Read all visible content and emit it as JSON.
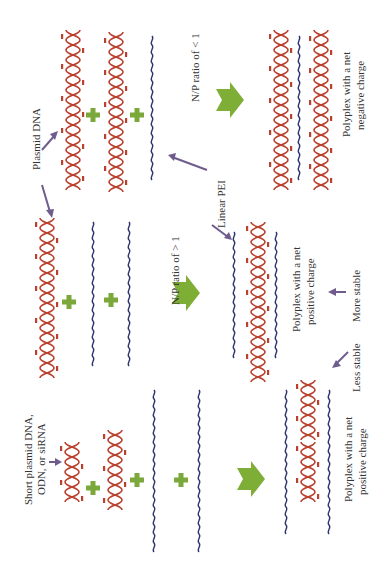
{
  "orientation": "rotated-90-ccw",
  "colors": {
    "dna": "#b9412e",
    "pei": "#2c3570",
    "plus": "#7aa83a",
    "arrow_green": "#7fae36",
    "arrow_purple": "#6e5c8e",
    "text": "#333333"
  },
  "labels": {
    "plasmid_dna": "Plasmid DNA",
    "short_dna_line1": "Short plasmid DNA,",
    "short_dna_line2": "ODN, or siRNA",
    "linear_pei": "Linear PEI",
    "np_less": "N/P ratio of < 1",
    "np_greater": "N/P ratio of > 1",
    "polyplex_negative_line1": "Polyplex with a net",
    "polyplex_negative_line2": "negative charge",
    "polyplex_positive_line1": "Polyplex with a net",
    "polyplex_positive_line2": "positive charge",
    "polyplex_positive2_line1": "Polyplex with a net",
    "polyplex_positive2_line2": "positive charge",
    "more_stable": "More stable",
    "less_stable": "Less stable"
  },
  "pei_groups": {
    "nh2": "NH₂",
    "nh3": "NH₃⁺",
    "plus": "+"
  },
  "rows": [
    {
      "name": "top-row",
      "reactants": [
        "plasmid-dna",
        "plasmid-dna",
        "linear-pei"
      ],
      "condition": "N/P ratio of < 1",
      "product": "polyplex-net-negative"
    },
    {
      "name": "middle-row",
      "reactants": [
        "plasmid-dna",
        "linear-pei",
        "linear-pei"
      ],
      "condition": "N/P ratio of > 1",
      "product": "polyplex-net-positive"
    },
    {
      "name": "bottom-row",
      "reactants": [
        "short-dna",
        "short-dna",
        "linear-pei",
        "linear-pei"
      ],
      "condition": "",
      "product": "polyplex-net-positive"
    }
  ]
}
